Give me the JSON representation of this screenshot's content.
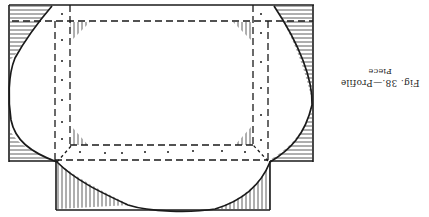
{
  "figure": {
    "caption_line1": "Fig. 38.—Profile",
    "caption_line2": "Piece",
    "orientation": "rotated 180°",
    "colors": {
      "ink": "#1a1a1a",
      "paper": "#ffffff"
    }
  }
}
